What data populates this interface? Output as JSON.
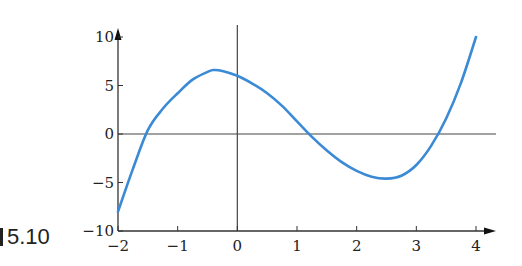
{
  "figure": {
    "label": "5.10"
  },
  "chart_data": {
    "type": "line",
    "title": "",
    "xlabel": "",
    "ylabel": "",
    "xlim": [
      -2,
      4
    ],
    "ylim": [
      -10,
      10
    ],
    "grid": false,
    "legend": null,
    "x_ticks": [
      -2,
      -1,
      0,
      1,
      2,
      3,
      4
    ],
    "x_tick_labels": [
      "−2",
      "−1",
      "0",
      "1",
      "2",
      "3",
      "4"
    ],
    "y_ticks": [
      -10,
      -5,
      0,
      5,
      10
    ],
    "y_tick_labels": [
      "−10",
      "−5",
      "0",
      "5",
      "10"
    ],
    "series": [
      {
        "name": "f(x)",
        "color": "#3a8ad6",
        "x": [
          -2,
          -1.75,
          -1.5,
          -1.25,
          -1,
          -0.75,
          -0.5,
          -0.4,
          -0.25,
          0,
          0.25,
          0.5,
          0.75,
          1,
          1.25,
          1.5,
          1.75,
          2,
          2.25,
          2.5,
          2.75,
          3,
          3.25,
          3.5,
          3.75,
          4
        ],
        "y": [
          -8,
          -3.6,
          0.4,
          2.6,
          4.2,
          5.6,
          6.4,
          6.6,
          6.5,
          6.0,
          5.2,
          4.2,
          2.9,
          1.3,
          -0.3,
          -1.7,
          -2.9,
          -3.8,
          -4.4,
          -4.6,
          -4.3,
          -3.2,
          -1.2,
          1.6,
          5.3,
          10
        ]
      }
    ],
    "roots_approx": [
      -1.55,
      1.2,
      3.3
    ],
    "local_max_approx": {
      "x": -0.4,
      "y": 6.6
    },
    "local_min_approx": {
      "x": 2.45,
      "y": -4.6
    }
  }
}
